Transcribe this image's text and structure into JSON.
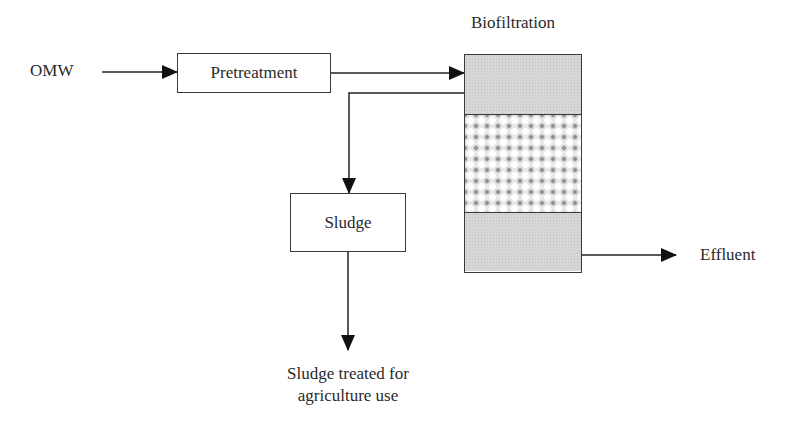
{
  "diagram": {
    "type": "process-flow",
    "nodes": {
      "input": {
        "label": "OMW"
      },
      "pretreatment": {
        "label": "Pretreatment"
      },
      "biofiltration": {
        "label": "Biofiltration",
        "sections": [
          "top-gray",
          "filter-media",
          "bottom-gray"
        ]
      },
      "sludge": {
        "label": "Sludge"
      },
      "sludge_output": {
        "line1": "Sludge treated for",
        "line2": "agriculture use"
      },
      "effluent": {
        "label": "Effluent"
      }
    },
    "edges": [
      {
        "from": "OMW",
        "to": "Pretreatment"
      },
      {
        "from": "Pretreatment",
        "to": "Biofiltration"
      },
      {
        "from": "Biofiltration",
        "to": "Sludge"
      },
      {
        "from": "Sludge",
        "to": "Sludge treated for agriculture use"
      },
      {
        "from": "Biofiltration",
        "to": "Effluent"
      }
    ],
    "colors": {
      "line": "#1a1a1a",
      "column_fill": "#d6d6d6",
      "media_dots": "#8f8f8f"
    }
  }
}
